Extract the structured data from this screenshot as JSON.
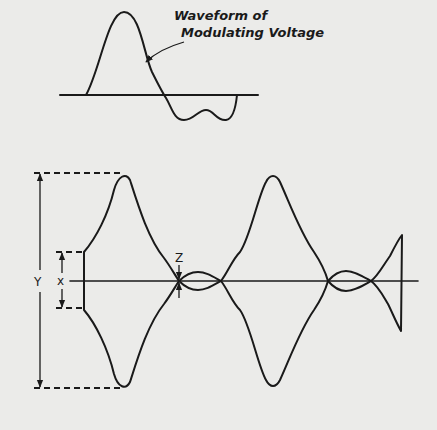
{
  "diagram": {
    "top_waveform": {
      "label_line1": "Waveform of",
      "label_line2": "Modulating Voltage"
    },
    "modulated_wave": {
      "labels": {
        "Y": "Y",
        "X": "X",
        "Z": "Z"
      }
    },
    "colors": {
      "background": "#ebebe9",
      "ink": "#1a1a1a"
    }
  }
}
